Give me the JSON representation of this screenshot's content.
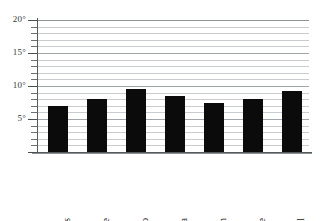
{
  "chart_data": {
    "type": "bar",
    "title": "",
    "xlabel": "",
    "ylabel": "",
    "ylim": [
      0,
      20
    ],
    "y_unit": "°",
    "grid": true,
    "grid_minor_step": 1,
    "grid_major_step": 5,
    "legend": "none",
    "categories": [
      "St Andrews",
      "Larne",
      "Sligo",
      "Swansea",
      "Harwich",
      "Eastbourne",
      "St Austell"
    ],
    "values": [
      7.0,
      8.0,
      9.5,
      8.5,
      7.5,
      8.0,
      9.2
    ],
    "ticks": [
      {
        "value": 20,
        "label": "20°"
      },
      {
        "value": 15,
        "label": "15°"
      },
      {
        "value": 10,
        "label": "10°"
      },
      {
        "value": 5,
        "label": "5°"
      }
    ],
    "bar_color": "#0b0b0b",
    "grid_color": "#c9cdd0",
    "axis_color": "#555a5c"
  },
  "axis": {
    "y_tick_labels": [
      "20°",
      "15°",
      "10°",
      "5°"
    ]
  },
  "categories_labels": {
    "c0": "St Andrews",
    "c1": "Larne",
    "c2": "Sligo",
    "c3": "Swansea",
    "c4": "Harwich",
    "c5": "Eastbourne",
    "c6": "St Austell"
  }
}
